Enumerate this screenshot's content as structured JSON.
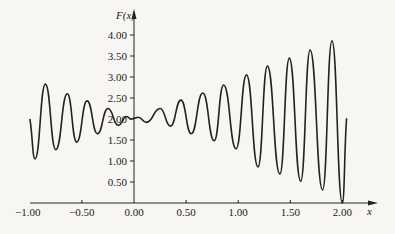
{
  "chart_data": {
    "type": "line",
    "title": "",
    "xlabel": "x",
    "ylabel": "F(x)",
    "xlim": [
      -1.0,
      2.1
    ],
    "ylim": [
      0,
      4.3
    ],
    "grid": false,
    "legend": null,
    "x_ticks": [
      -1.0,
      -0.5,
      0.0,
      0.5,
      1.0,
      1.5,
      2.0
    ],
    "x_tick_labels": [
      "−1.00",
      "−0.50",
      "0.00",
      "0.50",
      "1.00",
      "1.50",
      "2.00"
    ],
    "y_ticks": [
      0.5,
      1.0,
      1.5,
      2.0,
      2.5,
      3.0,
      3.5,
      4.0
    ],
    "y_tick_labels": [
      "0.50",
      "1.00",
      "1.50",
      "2.00",
      "2.50",
      "3.00",
      "3.50",
      "4.00"
    ],
    "series": [
      {
        "name": "F(x)",
        "color": "#222222",
        "x": [
          -1.0,
          -0.95,
          -0.85,
          -0.75,
          -0.64,
          -0.55,
          -0.45,
          -0.35,
          -0.25,
          -0.15,
          -0.07,
          -0.03,
          0.0,
          0.04,
          0.12,
          0.25,
          0.35,
          0.45,
          0.55,
          0.66,
          0.77,
          0.86,
          0.98,
          1.08,
          1.19,
          1.28,
          1.4,
          1.49,
          1.6,
          1.69,
          1.81,
          1.9,
          2.0,
          2.04
        ],
        "values": [
          2.0,
          1.05,
          2.83,
          1.27,
          2.6,
          1.45,
          2.43,
          1.65,
          2.25,
          1.85,
          2.06,
          2.0,
          2.02,
          2.04,
          1.92,
          2.25,
          1.83,
          2.45,
          1.65,
          2.62,
          1.48,
          2.81,
          1.29,
          3.05,
          0.86,
          3.26,
          0.69,
          3.45,
          0.52,
          3.64,
          0.31,
          3.86,
          0.0,
          2.02
        ]
      }
    ]
  },
  "axes": {
    "y_axis_label": "F(x)",
    "x_axis_label": "x",
    "x_tick_labels": [
      "−1.00",
      "−0.50",
      "0.00",
      "0.50",
      "1.00",
      "1.50",
      "2.00"
    ],
    "y_tick_labels": [
      "0.50",
      "1.00",
      "1.50",
      "2.00",
      "2.50",
      "3.00",
      "3.50",
      "4.00"
    ]
  }
}
